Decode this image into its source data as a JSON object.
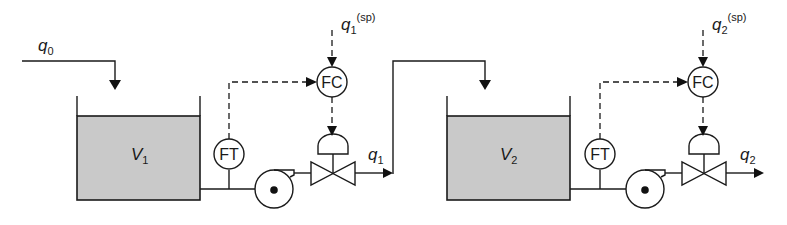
{
  "diagram": {
    "type": "process-flow",
    "labels": {
      "inlet_flow": {
        "base": "q",
        "sub": "0"
      },
      "tank1": {
        "base": "V",
        "sub": "1"
      },
      "tank2": {
        "base": "V",
        "sub": "2"
      },
      "outlet1": {
        "base": "q",
        "sub": "1"
      },
      "outlet2": {
        "base": "q",
        "sub": "2"
      },
      "setpoint1": {
        "base": "q",
        "sub": "1",
        "sup": "(sp)"
      },
      "setpoint2": {
        "base": "q",
        "sub": "2",
        "sup": "(sp)"
      },
      "flow_transmitter1": "FT",
      "flow_transmitter2": "FT",
      "flow_controller1": "FC",
      "flow_controller2": "FC"
    },
    "colors": {
      "line": "#1a1a1a",
      "liquid_fill": "#c9c9c9",
      "background": "#ffffff"
    }
  }
}
